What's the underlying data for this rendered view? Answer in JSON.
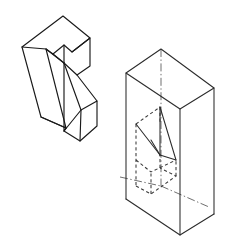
{
  "figure": {
    "title": "Isometric wedge bracket with enclosing construction box",
    "background_color": "#ffffff",
    "line_color": "#1a1a1a",
    "hidden_line_color": "#3a3a3a",
    "center_line_color": "#555555",
    "width_px": 227,
    "height_px": 244
  },
  "objects": [
    {
      "id": "wedge-part",
      "label": "Isometric wedge bracket part",
      "position": "left",
      "style": "solid visible edges only"
    },
    {
      "id": "enclosing-box",
      "label": "Rectangular enclosing box with part shown as hidden lines",
      "position": "right",
      "style": "solid box edges with dashed interior part and dash-dot center lines"
    }
  ],
  "geometry": {
    "wedge_part": {
      "top_face": "23,47 64,17 89,39 72,52 64,45 53,54 47,49",
      "upper_ramp": "47,49 64,63 72,52 64,45 53,54",
      "left_face": "23,47 47,49 66,127 41,118",
      "front_slope": "47,49 64,63 64,131 66,127",
      "notch_right": "72,52 89,39 89,66 77,75",
      "tab_front": "64,131 79,141 96,126 96,101 81,110",
      "tab_side": "79,141 96,126 96,101",
      "lower_join": "66,127 64,131 79,141"
    },
    "enclosing_box": {
      "top_rear": "126,73 161,49 214,88",
      "top_front": "126,73 180,109 214,88",
      "left_vertical": "126,73 126,199",
      "front_vertical": "180,109 180,235",
      "right_vertical": "214,88 214,214",
      "bottom": "126,199 180,235 214,214",
      "rear_vertical": "161,49 161,176"
    },
    "hidden_part": {
      "front_top": "136,125 160,108",
      "ramp": "136,125 160,155",
      "verticals": "136,125-136,186  160,108-160,176",
      "bottom_face": "136,186 160,176 175,162 151,172"
    },
    "center_lines": {
      "vertical": "161,49 to 161,185",
      "diagonal_left": "120,178 to 161,185",
      "diagonal_right": "161,185 to 208,207"
    }
  }
}
